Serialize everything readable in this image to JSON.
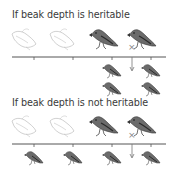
{
  "panels": [
    {
      "title": "If beak depth is heritable",
      "parents": {
        "eliminated_count": 2,
        "survivor_count": 2
      },
      "offspring": {
        "count": 4,
        "arrangement": "2x2 under survivors"
      },
      "marker": "x-mark",
      "arrow": "down-arrow"
    },
    {
      "title": "If beak depth is not heritable",
      "parents": {
        "eliminated_count": 2,
        "survivor_count": 2
      },
      "offspring": {
        "count": 4,
        "arrangement": "spread across axis"
      },
      "marker": "x-mark",
      "arrow": "down-arrow"
    }
  ],
  "colors": {
    "bird_fill": "#6b6b6b",
    "bird_dark": "#3a3a3a",
    "ghost_stroke": "#b8b8b8",
    "axis": "#555555",
    "text": "#3a3a3a"
  }
}
